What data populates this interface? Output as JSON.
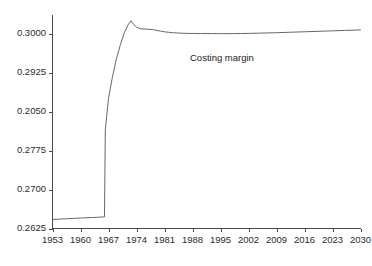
{
  "figure": {
    "title": "",
    "background_color": "#ffffff",
    "width": 372,
    "height": 266
  },
  "axes": {
    "line_color": "#4a4a4a",
    "y_ticks": [
      {
        "label": "0.3000",
        "value": 0.3
      },
      {
        "label": "0.2925",
        "value": 0.2925
      },
      {
        "label": "0.2050",
        "value": 0.285
      },
      {
        "label": "0.2775",
        "value": 0.2775
      },
      {
        "label": "0.2700",
        "value": 0.27
      },
      {
        "label": "0.2625",
        "value": 0.2625
      }
    ],
    "x_ticks": [
      {
        "label": "1953",
        "value": 1953
      },
      {
        "label": "1960",
        "value": 1960
      },
      {
        "label": "1967",
        "value": 1967
      },
      {
        "label": "1974",
        "value": 1974
      },
      {
        "label": "1981",
        "value": 1981
      },
      {
        "label": "1988",
        "value": 1988
      },
      {
        "label": "1995",
        "value": 1995
      },
      {
        "label": "2002",
        "value": 2002
      },
      {
        "label": "2009",
        "value": 2009
      },
      {
        "label": "2016",
        "value": 2016
      },
      {
        "label": "2023",
        "value": 2023
      },
      {
        "label": "2030",
        "value": 2030
      }
    ]
  },
  "annotations": [
    {
      "name": "costing-margin-label",
      "text": "Costing margin",
      "x_px": 190,
      "y_px": 52
    }
  ],
  "chart_data": {
    "type": "line",
    "title": "",
    "xlabel": "",
    "ylabel": "",
    "grid": false,
    "legend_position": "inline-annotation",
    "xlim": [
      1953,
      2030
    ],
    "ylim": [
      0.2625,
      0.30375
    ],
    "ytick_values": [
      0.2625,
      0.27,
      0.2775,
      0.285,
      0.2925,
      0.3
    ],
    "ytick_labels": [
      "0.2625",
      "0.2700",
      "0.2775",
      "0.2050",
      "0.2925",
      "0.3000"
    ],
    "xtick_values": [
      1953,
      1960,
      1967,
      1974,
      1981,
      1988,
      1995,
      2002,
      2009,
      2016,
      2023,
      2030
    ],
    "series": [
      {
        "name": "Costing margin",
        "color": "#555555",
        "line_width": 0.9,
        "x": [
          1953,
          1955,
          1957,
          1959,
          1961,
          1963,
          1964,
          1965,
          1965.6,
          1966,
          1966.2,
          1967,
          1968,
          1969,
          1970,
          1971,
          1972,
          1972.6,
          1973,
          1974,
          1975,
          1976,
          1977,
          1978,
          1979,
          1980,
          1981,
          1982,
          1983,
          1984,
          1985,
          1986,
          1988,
          1990,
          1993,
          1995,
          1998,
          2000,
          2002,
          2005,
          2009,
          2012,
          2016,
          2020,
          2023,
          2026,
          2030
        ],
        "y": [
          0.26425,
          0.26432,
          0.2644,
          0.26448,
          0.26456,
          0.26462,
          0.26466,
          0.2647,
          0.26472,
          0.26474,
          0.2815,
          0.2876,
          0.2918,
          0.2953,
          0.298,
          0.3003,
          0.3019,
          0.30255,
          0.3021,
          0.3013,
          0.301,
          0.30095,
          0.3009,
          0.30085,
          0.3007,
          0.30055,
          0.30042,
          0.30032,
          0.30025,
          0.3002,
          0.30016,
          0.30012,
          0.3001,
          0.30008,
          0.30007,
          0.30006,
          0.30006,
          0.30008,
          0.30011,
          0.30016,
          0.30024,
          0.30032,
          0.30042,
          0.30052,
          0.3006,
          0.30068,
          0.30078
        ]
      }
    ]
  }
}
